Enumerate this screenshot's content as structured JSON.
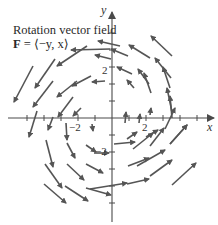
{
  "diagram": {
    "title_line1": "Rotation vector field",
    "title_line2_bold": "F",
    "title_line2_rest": " = ⟨−y, x⟩",
    "axes": {
      "x_label": "x",
      "y_label": "y",
      "tick_labels": {
        "x_neg": "−2",
        "x_pos": "2",
        "y_pos": "2",
        "y_neg": "−2"
      }
    },
    "colors": {
      "axis": "#4a4a4a",
      "arrow": "#555555",
      "text": "#2a2a2a"
    }
  },
  "chart_data": {
    "type": "vector_field",
    "title": "Rotation vector field",
    "formula": "F = ⟨−y, x⟩",
    "xlabel": "x",
    "ylabel": "y",
    "x_ticks": [
      -5,
      -4,
      -3,
      -2,
      -1,
      1,
      2,
      3,
      4,
      5
    ],
    "y_ticks": [
      -5,
      -4,
      -3,
      -2,
      -1,
      1,
      2,
      3,
      4,
      5
    ],
    "labeled_ticks": {
      "x": [
        -2,
        2
      ],
      "y": [
        -2,
        2
      ]
    },
    "origin_px": [
      112,
      118
    ],
    "unit_px": 17,
    "arrows_px": [
      [
        33,
        66,
        14,
        102
      ],
      [
        55,
        59,
        35,
        88
      ],
      [
        87,
        46,
        57,
        66
      ],
      [
        110,
        49,
        71,
        50
      ],
      [
        120,
        46,
        98,
        41
      ],
      [
        77,
        81,
        57,
        97
      ],
      [
        53,
        81,
        33,
        107
      ],
      [
        73,
        97,
        58,
        117
      ],
      [
        91,
        76,
        72,
        86
      ],
      [
        105,
        81,
        92,
        82
      ],
      [
        37,
        111,
        29,
        137
      ],
      [
        53,
        117,
        48,
        130
      ],
      [
        81,
        108,
        73,
        116
      ],
      [
        92,
        124,
        93,
        131
      ],
      [
        66,
        123,
        67,
        140
      ],
      [
        46,
        140,
        53,
        167
      ],
      [
        67,
        143,
        75,
        158
      ],
      [
        86,
        145,
        96,
        152
      ],
      [
        45,
        164,
        62,
        188
      ],
      [
        67,
        164,
        84,
        180
      ],
      [
        86,
        164,
        103,
        173
      ],
      [
        44,
        184,
        66,
        203
      ],
      [
        65,
        186,
        88,
        201
      ],
      [
        86,
        188,
        111,
        195
      ],
      [
        94,
        153,
        109,
        153
      ],
      [
        114,
        144,
        135,
        142
      ],
      [
        128,
        166,
        149,
        158
      ],
      [
        127,
        184,
        149,
        179
      ],
      [
        90,
        189,
        127,
        183
      ],
      [
        137,
        166,
        165,
        150
      ],
      [
        150,
        176,
        172,
        160
      ],
      [
        133,
        149,
        153,
        133
      ],
      [
        150,
        146,
        164,
        128
      ],
      [
        170,
        144,
        187,
        125
      ],
      [
        146,
        137,
        158,
        130
      ],
      [
        127,
        139,
        137,
        132
      ],
      [
        172,
        185,
        196,
        163
      ],
      [
        170,
        144,
        187,
        125
      ],
      [
        165,
        129,
        175,
        108
      ],
      [
        150,
        115,
        151,
        108
      ],
      [
        139,
        123,
        140,
        114
      ],
      [
        125,
        123,
        126,
        112
      ],
      [
        172,
        118,
        170,
        96
      ],
      [
        172,
        112,
        167,
        88
      ],
      [
        170,
        88,
        163,
        67
      ],
      [
        151,
        93,
        144,
        73
      ],
      [
        149,
        84,
        138,
        69
      ],
      [
        171,
        78,
        155,
        58
      ],
      [
        172,
        56,
        151,
        36
      ],
      [
        150,
        58,
        129,
        45
      ],
      [
        134,
        88,
        127,
        80
      ],
      [
        132,
        74,
        117,
        67
      ],
      [
        128,
        56,
        111,
        49
      ],
      [
        111,
        59,
        95,
        55
      ]
    ]
  }
}
